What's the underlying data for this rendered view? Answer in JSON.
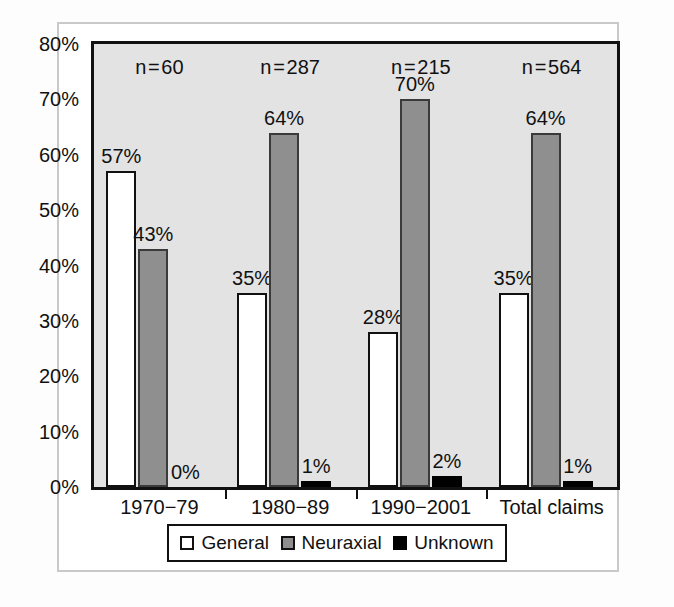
{
  "chart_data": {
    "type": "bar",
    "title": "",
    "subtitle": "",
    "xlabel": "",
    "ylabel": "",
    "ylim": [
      0,
      80
    ],
    "ytick_labels": [
      "0%",
      "10%",
      "20%",
      "30%",
      "40%",
      "50%",
      "60%",
      "70%",
      "80%"
    ],
    "ytick_values": [
      0,
      10,
      20,
      30,
      40,
      50,
      60,
      70,
      80
    ],
    "grid": false,
    "legend_position": "bottom",
    "categories": [
      "1970−79",
      "1980−89",
      "1990−2001",
      "Total claims"
    ],
    "group_annotations": [
      "n = 60",
      "n = 287",
      "n = 215",
      "n = 564"
    ],
    "series": [
      {
        "name": "General",
        "color": "#ffffff",
        "values": [
          57,
          35,
          28,
          35
        ],
        "data_labels": [
          "57%",
          "35%",
          "28%",
          "35%"
        ]
      },
      {
        "name": "Neuraxial",
        "color": "#8f8f8f",
        "values": [
          43,
          64,
          70,
          64
        ],
        "data_labels": [
          "43%",
          "64%",
          "70%",
          "64%"
        ]
      },
      {
        "name": "Unknown",
        "color": "#000000",
        "values": [
          0,
          1,
          2,
          1
        ],
        "data_labels": [
          "0%",
          "1%",
          "2%",
          "1%"
        ]
      }
    ]
  },
  "legend": {
    "items": [
      {
        "label": "General",
        "swatch": "general"
      },
      {
        "label": "Neuraxial",
        "swatch": "neuraxial"
      },
      {
        "label": "Unknown",
        "swatch": "unknown"
      }
    ]
  }
}
